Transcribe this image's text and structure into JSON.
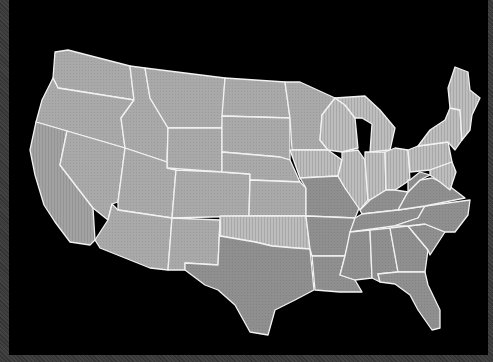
{
  "map": {
    "type": "choropleth",
    "region": "Contiguous United States",
    "background": "#000000",
    "frame_color": "#3b3b3b",
    "border_color": "#f2f2f2",
    "shade_levels": {
      "light": "#b4b4b4",
      "medium": "#a6a6a6",
      "dark": "#8e8e8e",
      "striped_light": "#c0c0c0"
    },
    "states": [
      {
        "id": "WA",
        "shade": "medium"
      },
      {
        "id": "OR",
        "shade": "medium"
      },
      {
        "id": "CA",
        "shade": "medium"
      },
      {
        "id": "ID",
        "shade": "medium"
      },
      {
        "id": "NV",
        "shade": "medium"
      },
      {
        "id": "MT",
        "shade": "medium"
      },
      {
        "id": "WY",
        "shade": "medium"
      },
      {
        "id": "UT",
        "shade": "medium"
      },
      {
        "id": "AZ",
        "shade": "medium"
      },
      {
        "id": "CO",
        "shade": "medium"
      },
      {
        "id": "NM",
        "shade": "medium"
      },
      {
        "id": "ND",
        "shade": "medium"
      },
      {
        "id": "SD",
        "shade": "medium"
      },
      {
        "id": "NE",
        "shade": "medium"
      },
      {
        "id": "KS",
        "shade": "medium"
      },
      {
        "id": "OK",
        "shade": "striped_light"
      },
      {
        "id": "TX",
        "shade": "dark"
      },
      {
        "id": "MN",
        "shade": "medium"
      },
      {
        "id": "IA",
        "shade": "striped_light"
      },
      {
        "id": "MO",
        "shade": "dark"
      },
      {
        "id": "AR",
        "shade": "dark"
      },
      {
        "id": "LA",
        "shade": "dark"
      },
      {
        "id": "WI",
        "shade": "striped_light"
      },
      {
        "id": "IL",
        "shade": "striped_light"
      },
      {
        "id": "MI",
        "shade": "striped_light"
      },
      {
        "id": "IN",
        "shade": "striped_light"
      },
      {
        "id": "OH",
        "shade": "striped_light"
      },
      {
        "id": "KY",
        "shade": "dark"
      },
      {
        "id": "TN",
        "shade": "dark"
      },
      {
        "id": "MS",
        "shade": "dark"
      },
      {
        "id": "AL",
        "shade": "dark"
      },
      {
        "id": "GA",
        "shade": "dark"
      },
      {
        "id": "FL",
        "shade": "dark"
      },
      {
        "id": "SC",
        "shade": "dark"
      },
      {
        "id": "NC",
        "shade": "dark"
      },
      {
        "id": "VA",
        "shade": "dark"
      },
      {
        "id": "WV",
        "shade": "dark"
      },
      {
        "id": "PA",
        "shade": "striped_light"
      },
      {
        "id": "NY",
        "shade": "striped_light"
      },
      {
        "id": "NE-states",
        "shade": "striped_light"
      }
    ]
  }
}
